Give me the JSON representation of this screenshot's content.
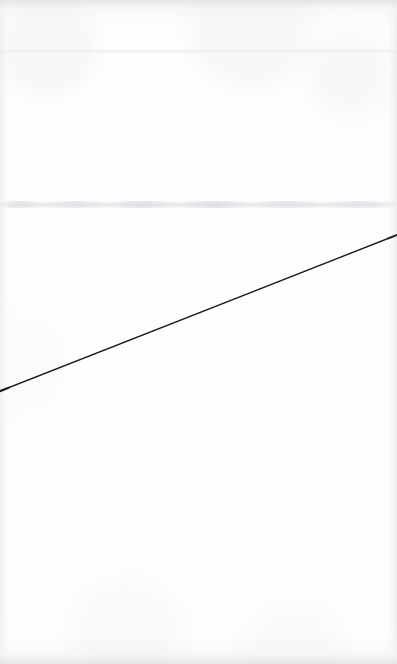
{
  "page": {
    "title": "Scanned blank page with single diagonal line",
    "width": 397,
    "height": 664,
    "background_color": "#ffffff",
    "paper_tone_color": "#fefefe",
    "edge_shadow_color": "#e5e5e7"
  },
  "artifacts": {
    "seam_upper": {
      "label": "faint horizontal scan seam (upper)",
      "y": 51,
      "color": "#e9e9ec"
    },
    "seam_mid": {
      "label": "faint horizontal scan seam (middle)",
      "y": 205,
      "color": "#e1e1e5"
    }
  },
  "chart_data": {
    "type": "line",
    "title": "",
    "subtitle": "",
    "xlabel": "",
    "ylabel": "",
    "grid": false,
    "legend": null,
    "axis_visible": false,
    "tick_labels_x": [],
    "tick_labels_y": [],
    "xlim": [
      0,
      397
    ],
    "ylim": [
      0,
      664
    ],
    "series": [
      {
        "name": "diagonal-line",
        "color": "#1a1a1a",
        "stroke_width": 1.4,
        "x": [
          0,
          100,
          200,
          300,
          397
        ],
        "y": [
          391,
          358,
          319,
          268,
          235
        ],
        "points": [
          {
            "x": 0,
            "y": 391
          },
          {
            "x": 100,
            "y": 358
          },
          {
            "x": 200,
            "y": 319
          },
          {
            "x": 300,
            "y": 268
          },
          {
            "x": 397,
            "y": 235
          }
        ]
      }
    ],
    "annotations": []
  },
  "line": {
    "name": "diagonal-line",
    "color": "#1a1a1a",
    "stroke_width": "1.4",
    "x1": "0",
    "y1": "391",
    "x2": "397",
    "y2": "235",
    "description": "Single straight black line ascending left-to-right across the page"
  }
}
